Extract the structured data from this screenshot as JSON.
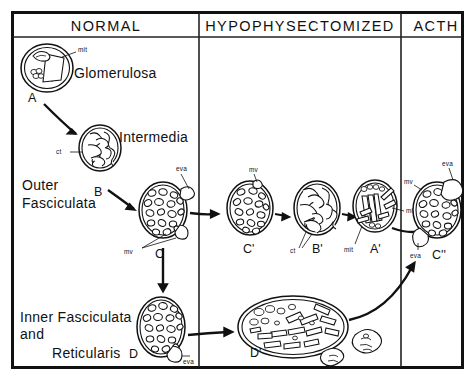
{
  "figure": {
    "columns": [
      {
        "id": "normal",
        "label": "NORMAL"
      },
      {
        "id": "hypophysectomized",
        "label": "HYPOPHYSECTOMIZED"
      },
      {
        "id": "acth",
        "label": "ACTH"
      }
    ],
    "zone_labels": [
      {
        "id": "glomerulosa",
        "text": "Glomerulosa"
      },
      {
        "id": "intermedia",
        "text": "Intermedia"
      },
      {
        "id": "outer-fasciculata-line1",
        "text": "Outer"
      },
      {
        "id": "outer-fasciculata-line2",
        "text": "Fasciculata"
      },
      {
        "id": "inner-line1",
        "text": "Inner Fasciculata"
      },
      {
        "id": "inner-line2",
        "text": "and"
      },
      {
        "id": "inner-line3",
        "text": "Reticularis"
      }
    ],
    "cells": [
      {
        "id": "A",
        "letter": "A",
        "column": "normal",
        "zone": "glomerulosa"
      },
      {
        "id": "B",
        "letter": "B",
        "column": "normal",
        "zone": "intermedia"
      },
      {
        "id": "C",
        "letter": "C",
        "column": "normal",
        "zone": "outer-fasciculata"
      },
      {
        "id": "D",
        "letter": "D",
        "column": "normal",
        "zone": "inner-fasciculata-reticularis"
      },
      {
        "id": "Cp",
        "letter": "C'",
        "column": "hypophysectomized",
        "zone": "outer-fasciculata"
      },
      {
        "id": "Bp",
        "letter": "B'",
        "column": "hypophysectomized",
        "zone": "outer-fasciculata"
      },
      {
        "id": "Ap",
        "letter": "A'",
        "column": "hypophysectomized",
        "zone": "outer-fasciculata"
      },
      {
        "id": "Dp",
        "letter": "D'",
        "column": "hypophysectomized",
        "zone": "inner-fasciculata-reticularis"
      },
      {
        "id": "Cpp",
        "letter": "C''",
        "column": "acth",
        "zone": "outer-fasciculata"
      }
    ],
    "organelle_labels": [
      {
        "id": "mit-A",
        "text": "mit",
        "cell": "A"
      },
      {
        "id": "ct-B",
        "text": "ct",
        "cell": "B"
      },
      {
        "id": "eva-C",
        "text": "eva",
        "cell": "C"
      },
      {
        "id": "mv-C",
        "text": "mv",
        "cell": "C"
      },
      {
        "id": "eva-D",
        "text": "eva",
        "cell": "D"
      },
      {
        "id": "mv-Cp",
        "text": "mv",
        "cell": "Cp"
      },
      {
        "id": "ct-Bp",
        "text": "ct",
        "cell": "Bp"
      },
      {
        "id": "mit-Ap-right",
        "text": "mit",
        "cell": "Ap"
      },
      {
        "id": "mit-Ap-left",
        "text": "mit",
        "cell": "Ap"
      },
      {
        "id": "eva-Cpp-top",
        "text": "eva",
        "cell": "Cpp"
      },
      {
        "id": "mv-Cpp",
        "text": "mv",
        "cell": "Cpp"
      },
      {
        "id": "eva-Cpp-bot",
        "text": "eva",
        "cell": "Cpp"
      }
    ],
    "colors": {
      "ink": "#111111",
      "background": "#ffffff"
    }
  }
}
